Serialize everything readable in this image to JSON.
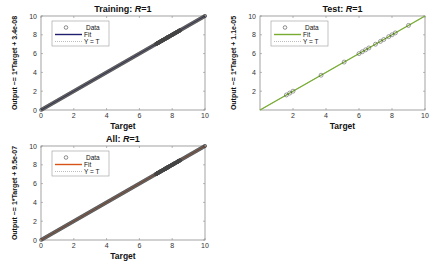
{
  "chart_data": [
    {
      "type": "scatter",
      "id": "training",
      "title": "Training: R=1",
      "title_prefix": "Training: ",
      "title_var": "R",
      "title_suffix": "=1",
      "xlabel": "Target",
      "ylabel": "Output ~= 1*Target + 3.4e-08",
      "xlim": [
        0,
        10
      ],
      "ylim": [
        0,
        10
      ],
      "xticks": [
        "0",
        "2",
        "4",
        "6",
        "8",
        "10"
      ],
      "yticks": [
        "0",
        "2",
        "4",
        "6",
        "8",
        "10"
      ],
      "fit_color": "#1f1f6e",
      "legend": [
        "Data",
        "Fit",
        "Y = T"
      ],
      "fit": {
        "slope": 1,
        "intercept": 3.4e-08
      },
      "data_description": "Dense points along y=x from 0 to 10, heavier cluster between 7 and 8.5",
      "grid": false
    },
    {
      "type": "scatter",
      "id": "test",
      "title": "Test: R=1",
      "title_prefix": "Test: ",
      "title_var": "R",
      "title_suffix": "=1",
      "xlabel": "Target",
      "ylabel": "Output ~= 1*Target + 1.1e-05",
      "xlim": [
        0,
        10
      ],
      "ylim": [
        0,
        10
      ],
      "xticks": [
        "2",
        "4",
        "6",
        "8",
        "10"
      ],
      "yticks": [
        "2",
        "4",
        "6",
        "8",
        "10"
      ],
      "fit_color": "#77ac30",
      "legend": [
        "Data",
        "Fit",
        "Y = T"
      ],
      "fit": {
        "slope": 1,
        "intercept": 1.1e-05
      },
      "x": [
        1.6,
        1.8,
        2.0,
        3.7,
        5.1,
        6.0,
        6.2,
        6.4,
        6.6,
        7.0,
        7.3,
        7.5,
        7.8,
        8.0,
        8.2,
        9.0
      ],
      "y": [
        1.6,
        1.8,
        2.0,
        3.7,
        5.1,
        6.0,
        6.2,
        6.4,
        6.6,
        7.0,
        7.3,
        7.5,
        7.8,
        8.0,
        8.2,
        9.0
      ],
      "grid": false
    },
    {
      "type": "scatter",
      "id": "all",
      "title": "All: R=1",
      "title_prefix": "All: ",
      "title_var": "R",
      "title_suffix": "=1",
      "xlabel": "Target",
      "ylabel": "Output ~= 1*Target + 9.5e-07",
      "xlim": [
        0,
        10
      ],
      "ylim": [
        0,
        10
      ],
      "xticks": [
        "0",
        "2",
        "4",
        "6",
        "8",
        "10"
      ],
      "yticks": [
        "0",
        "2",
        "4",
        "6",
        "8",
        "10"
      ],
      "fit_color": "#d95319",
      "legend": [
        "Data",
        "Fit",
        "Y = T"
      ],
      "fit": {
        "slope": 1,
        "intercept": 9.5e-07
      },
      "data_description": "Dense points along y=x from 0 to 10, heavier cluster between 7 and 8.5",
      "grid": false
    }
  ]
}
